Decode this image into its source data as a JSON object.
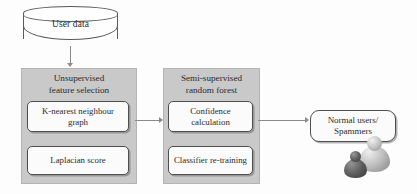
{
  "diagram": {
    "datastore": {
      "label": "User data",
      "icon": "cylinder-database-icon"
    },
    "stages": [
      {
        "id": "unsupervised-feature-selection",
        "title": "Unsupervised\nfeature selection",
        "title_line1": "Unsupervised",
        "title_line2": "feature selection",
        "steps": [
          {
            "id": "knn-graph",
            "label": "K-nearest neighbour\ngraph",
            "line1": "K-nearest neighbour",
            "line2": "graph"
          },
          {
            "id": "laplacian-score",
            "label": "Laplacian score",
            "line1": "Laplacian score",
            "line2": ""
          }
        ]
      },
      {
        "id": "semi-supervised-random-forest",
        "title": "Semi-supervised\nrandom forest",
        "title_line1": "Semi-supervised",
        "title_line2": "random forest",
        "steps": [
          {
            "id": "confidence-calculation",
            "label": "Confidence\ncalculation",
            "line1": "Confidence",
            "line2": "calculation"
          },
          {
            "id": "classifier-re-training",
            "label": "Classifier re-training",
            "line1": "Classifier re-training",
            "line2": ""
          }
        ]
      }
    ],
    "output": {
      "id": "classification-output",
      "label": "Normal users/\nSpammers",
      "line1": "Normal users/",
      "line2": "Spammers",
      "icon": "users-figurines-icon"
    },
    "connectors": [
      {
        "id": "datastore-to-unsupervised",
        "direction": "down"
      },
      {
        "id": "unsupervised-to-semisupervised",
        "direction": "right"
      },
      {
        "id": "semisupervised-to-output",
        "direction": "right"
      }
    ],
    "colors": {
      "panel_fill": "#c9c9c9",
      "box_fill": "#fbfbfb",
      "box_border": "#4f4f4f",
      "connector": "#8a8a8a",
      "text": "#2b2b2b",
      "background": "#fdfdfd"
    }
  }
}
